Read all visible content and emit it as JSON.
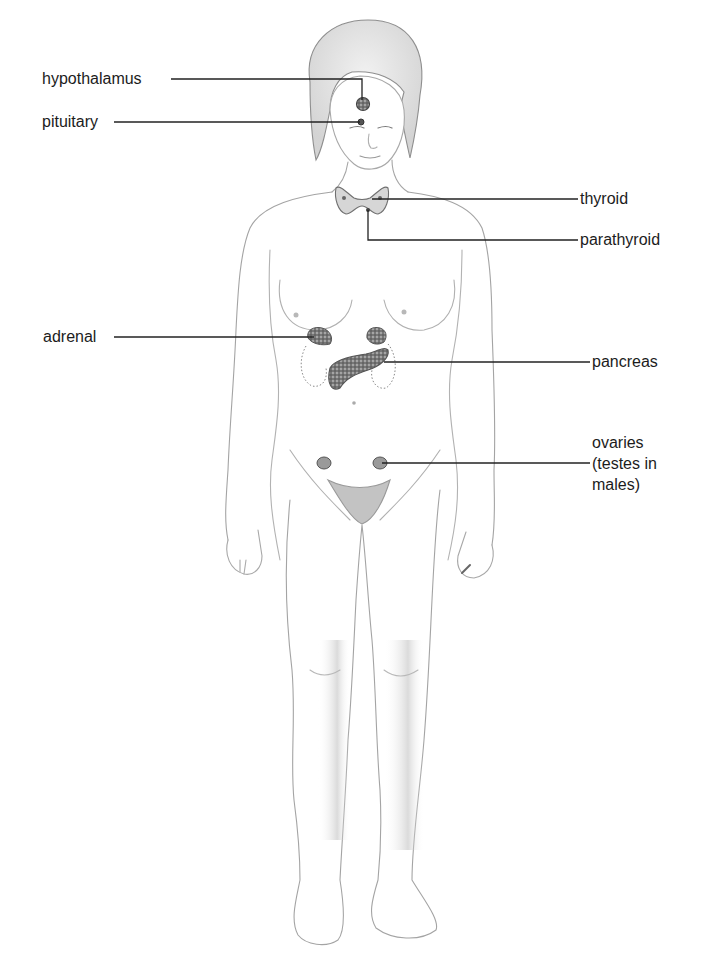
{
  "diagram": {
    "type": "anatomical-labeled-illustration",
    "colors": {
      "background": "#ffffff",
      "outline": "#9a9a9a",
      "shading": "#c8c8c8",
      "gland_fill": "#8c8c8c",
      "gland_dark": "#555555",
      "leader_line": "#222222",
      "text": "#1c1c1c"
    },
    "labels": [
      {
        "id": "hypothalamus",
        "text": "hypothalamus",
        "side": "left"
      },
      {
        "id": "pituitary",
        "text": "pituitary",
        "side": "left"
      },
      {
        "id": "thyroid",
        "text": "thyroid",
        "side": "right"
      },
      {
        "id": "parathyroid",
        "text": "parathyroid",
        "side": "right"
      },
      {
        "id": "adrenal",
        "text": "adrenal",
        "side": "left"
      },
      {
        "id": "pancreas",
        "text": "pancreas",
        "side": "right"
      },
      {
        "id": "ovaries",
        "lines": [
          "ovaries",
          "(testes in",
          "males)"
        ],
        "side": "right"
      }
    ]
  }
}
